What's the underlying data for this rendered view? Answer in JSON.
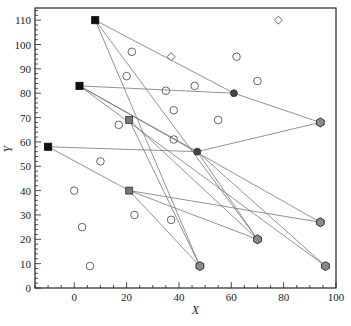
{
  "chart_data": {
    "type": "scatter",
    "title": "",
    "xlabel": "X",
    "ylabel": "Y",
    "xlim": [
      -15,
      100
    ],
    "ylim": [
      0,
      115
    ],
    "x_ticks": [
      0,
      20,
      40,
      60,
      80,
      100
    ],
    "y_ticks": [
      0,
      10,
      20,
      30,
      40,
      50,
      60,
      70,
      80,
      90,
      100,
      110
    ],
    "grid": false,
    "legend": null,
    "series": [
      {
        "name": "sources",
        "marker": "filled-square",
        "color": "#111111",
        "points": [
          {
            "x": 8,
            "y": 110
          },
          {
            "x": 2,
            "y": 83
          },
          {
            "x": -10,
            "y": 58
          }
        ]
      },
      {
        "name": "intermediate-squares",
        "marker": "gray-square",
        "color": "#666666",
        "points": [
          {
            "x": 21,
            "y": 69
          },
          {
            "x": 21,
            "y": 40
          }
        ]
      },
      {
        "name": "hubs",
        "marker": "filled-circle",
        "color": "#555555",
        "points": [
          {
            "x": 61,
            "y": 80
          },
          {
            "x": 47,
            "y": 56
          }
        ]
      },
      {
        "name": "depots",
        "marker": "gray-hexagon",
        "color": "#888888",
        "points": [
          {
            "x": 94,
            "y": 68
          },
          {
            "x": 94,
            "y": 27
          },
          {
            "x": 70,
            "y": 20
          },
          {
            "x": 48,
            "y": 9
          },
          {
            "x": 96,
            "y": 9
          }
        ]
      },
      {
        "name": "customers",
        "marker": "open-circle",
        "color": "#444444",
        "points": [
          {
            "x": 22,
            "y": 97
          },
          {
            "x": 62,
            "y": 95
          },
          {
            "x": 20,
            "y": 87
          },
          {
            "x": 70,
            "y": 85
          },
          {
            "x": 46,
            "y": 83
          },
          {
            "x": 35,
            "y": 81
          },
          {
            "x": 38,
            "y": 73
          },
          {
            "x": 55,
            "y": 69
          },
          {
            "x": 17,
            "y": 67
          },
          {
            "x": 38,
            "y": 61
          },
          {
            "x": 10,
            "y": 52
          },
          {
            "x": 0,
            "y": 40
          },
          {
            "x": 23,
            "y": 30
          },
          {
            "x": 37,
            "y": 28
          },
          {
            "x": 3,
            "y": 25
          },
          {
            "x": 6,
            "y": 9
          }
        ]
      },
      {
        "name": "open-diamonds",
        "marker": "open-diamond",
        "color": "#444444",
        "points": [
          {
            "x": 78,
            "y": 110
          },
          {
            "x": 37,
            "y": 95
          }
        ]
      }
    ],
    "edges": [
      {
        "from": [
          8,
          110
        ],
        "to": [
          61,
          80
        ]
      },
      {
        "from": [
          8,
          110
        ],
        "to": [
          48,
          9
        ]
      },
      {
        "from": [
          8,
          110
        ],
        "to": [
          70,
          20
        ]
      },
      {
        "from": [
          2,
          83
        ],
        "to": [
          61,
          80
        ]
      },
      {
        "from": [
          2,
          83
        ],
        "to": [
          47,
          56
        ]
      },
      {
        "from": [
          2,
          83
        ],
        "to": [
          94,
          27
        ]
      },
      {
        "from": [
          2,
          83
        ],
        "to": [
          96,
          9
        ]
      },
      {
        "from": [
          -10,
          58
        ],
        "to": [
          47,
          56
        ]
      },
      {
        "from": [
          -10,
          58
        ],
        "to": [
          21,
          40
        ]
      },
      {
        "from": [
          21,
          69
        ],
        "to": [
          48,
          9
        ]
      },
      {
        "from": [
          21,
          69
        ],
        "to": [
          70,
          20
        ]
      },
      {
        "from": [
          21,
          40
        ],
        "to": [
          94,
          27
        ]
      },
      {
        "from": [
          21,
          40
        ],
        "to": [
          70,
          20
        ]
      },
      {
        "from": [
          21,
          40
        ],
        "to": [
          48,
          9
        ]
      },
      {
        "from": [
          47,
          56
        ],
        "to": [
          94,
          68
        ]
      },
      {
        "from": [
          47,
          56
        ],
        "to": [
          96,
          9
        ]
      },
      {
        "from": [
          47,
          56
        ],
        "to": [
          70,
          20
        ]
      },
      {
        "from": [
          61,
          80
        ],
        "to": [
          94,
          68
        ]
      }
    ]
  },
  "axes": {
    "x_title": "X",
    "y_title": "Y"
  }
}
